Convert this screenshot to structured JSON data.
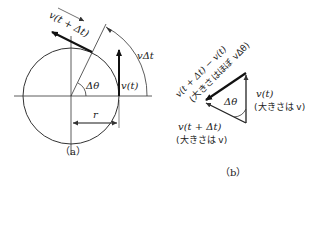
{
  "figure_a": {
    "caption": "（a）",
    "labels": {
      "v_t_dt": "v(t + Δt)",
      "v_dt": "vΔt",
      "delta_theta": "Δθ",
      "v_t": "v(t)",
      "r": "r"
    }
  },
  "figure_b": {
    "caption": "（b）",
    "labels": {
      "diff": "v(t + Δt) − v(t)",
      "diff_magnitude": "(大きさはほぼ vΔθ)",
      "v_t": "v(t)",
      "v_t_magnitude": "(大きさは v)",
      "delta_theta": "Δθ",
      "v_t_dt": "v(t + Δt)",
      "v_t_dt_magnitude": "(大きさは v)"
    }
  },
  "colors": {
    "line": "#333333",
    "arrow": "#111111"
  }
}
